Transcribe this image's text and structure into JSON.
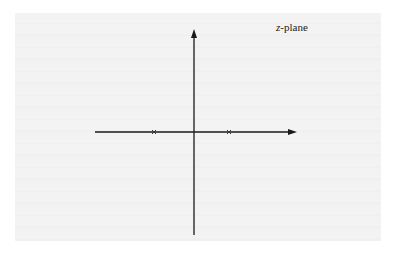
{
  "diagram": {
    "plane_label_var": "z",
    "plane_label_rest": "-plane",
    "axes": {
      "origin": [
        194,
        132
      ],
      "real_axis": {
        "x_start": 95,
        "x_end": 296,
        "y": 132,
        "arrow": "right"
      },
      "imag_axis": {
        "x": 194,
        "y_start": 235,
        "y_end": 29,
        "arrow": "up"
      }
    },
    "poles": [
      {
        "marker": "x",
        "x": 154,
        "y": 132
      },
      {
        "marker": "x",
        "x": 229,
        "y": 132
      }
    ],
    "colors": {
      "axis": "#1a1a1a",
      "pole": "#333333",
      "page": "#f3f3f3",
      "background": "#ffffff"
    }
  }
}
